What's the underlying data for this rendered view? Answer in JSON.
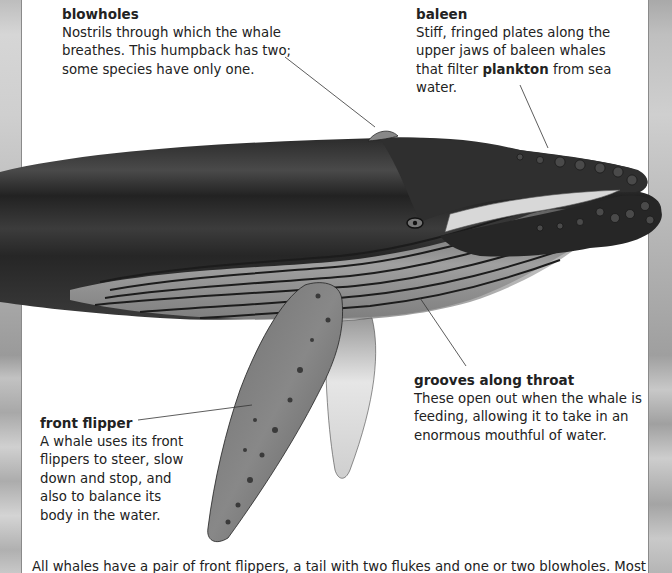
{
  "page": {
    "colors": {
      "text": "#222222",
      "background": "#ffffff",
      "whale_dark": "#2a2a2a",
      "whale_mid": "#5a5a5a",
      "strip_gray": "#b5b5b5"
    }
  },
  "labels": {
    "blowholes": {
      "title": "blowholes",
      "body": "Nostrils through which the whale breathes. This humpback has two; some species have only one."
    },
    "baleen": {
      "title": "baleen",
      "body_before": "Stiff, fringed plates along the upper jaws of baleen whales that filter ",
      "body_bold": "plankton",
      "body_after": " from sea water."
    },
    "front_flipper": {
      "title": "front flipper",
      "body": "A whale uses its front flippers to steer, slow down and stop, and also to balance its body in the water."
    },
    "grooves": {
      "title": "grooves along throat",
      "body": "These open out when the whale is feeding, allowing it to take in an enormous mouthful of water."
    }
  },
  "footer": {
    "text": "All whales have a pair of front flippers, a tail with two flukes and one or two blowholes. Most"
  }
}
